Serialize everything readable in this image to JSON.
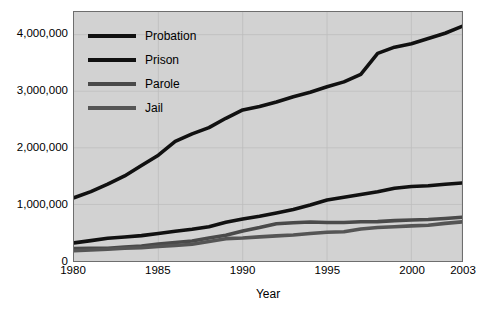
{
  "chart_data": {
    "type": "line",
    "title": "",
    "xlabel": "Year",
    "ylabel": "",
    "xlim": [
      1980,
      2003
    ],
    "ylim": [
      0,
      4400000
    ],
    "grid": true,
    "legend_position": "top-left",
    "x_ticks": [
      1980,
      1985,
      1990,
      1995,
      2000,
      2003
    ],
    "x_tick_labels": [
      "1980",
      "1985",
      "1990",
      "1995",
      "2000",
      "2003"
    ],
    "y_ticks": [
      0,
      1000000,
      2000000,
      3000000,
      4000000
    ],
    "y_tick_labels": [
      "0",
      "1,000,000",
      "2,000,000",
      "3,000,000",
      "4,000,000"
    ],
    "x": [
      1980,
      1981,
      1982,
      1983,
      1984,
      1985,
      1986,
      1987,
      1988,
      1989,
      1990,
      1991,
      1992,
      1993,
      1994,
      1995,
      1996,
      1997,
      1998,
      1999,
      2000,
      2001,
      2002,
      2003
    ],
    "series": [
      {
        "name": "Probation",
        "color": "#111111",
        "values": [
          1118000,
          1225000,
          1357000,
          1503000,
          1687000,
          1870000,
          2114000,
          2247000,
          2356000,
          2522000,
          2670000,
          2729000,
          2811000,
          2903000,
          2981000,
          3078000,
          3165000,
          3297000,
          3670000,
          3779000,
          3840000,
          3932000,
          4025000,
          4145000
        ]
      },
      {
        "name": "Prison",
        "color": "#111111",
        "values": [
          320000,
          360000,
          402000,
          424000,
          448000,
          487000,
          526000,
          562000,
          607000,
          683000,
          743000,
          792000,
          850000,
          909000,
          990000,
          1078000,
          1127000,
          1176000,
          1224000,
          1287000,
          1316000,
          1330000,
          1355000,
          1380000
        ]
      },
      {
        "name": "Parole",
        "color": "#4a4a4a",
        "values": [
          220000,
          225000,
          224000,
          246000,
          266000,
          300000,
          327000,
          355000,
          407000,
          456000,
          531000,
          590000,
          658000,
          676000,
          690000,
          679000,
          680000,
          694000,
          696000,
          714000,
          724000,
          732000,
          750000,
          774000
        ]
      },
      {
        "name": "Jail",
        "color": "#555555",
        "values": [
          182000,
          196000,
          209000,
          224000,
          234000,
          256000,
          274000,
          295000,
          343000,
          395000,
          405000,
          426000,
          444000,
          459000,
          486000,
          507000,
          518000,
          567000,
          592000,
          605000,
          621000,
          631000,
          665000,
          691000
        ]
      }
    ]
  },
  "legend": {
    "items": [
      {
        "label": "Probation",
        "color": "#111111"
      },
      {
        "label": "Prison",
        "color": "#111111"
      },
      {
        "label": "Parole",
        "color": "#4a4a4a"
      },
      {
        "label": "Jail",
        "color": "#555555"
      }
    ]
  },
  "axis": {
    "x_title": "Year"
  }
}
